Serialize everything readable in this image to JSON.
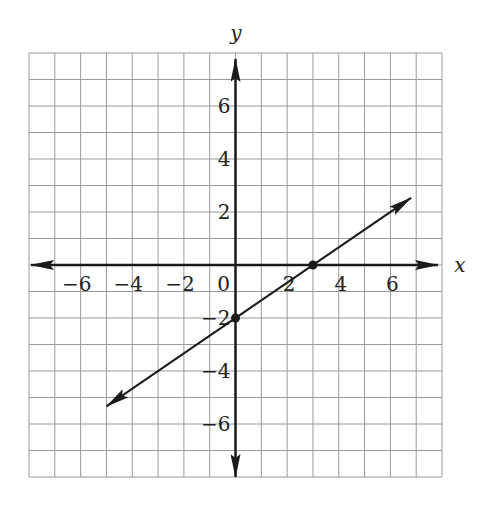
{
  "chart_data": {
    "type": "line",
    "title": "",
    "xlabel": "x",
    "ylabel": "y",
    "xlim": [
      -8,
      8
    ],
    "ylim": [
      -8,
      8
    ],
    "grid": true,
    "grid_step": 1,
    "x_ticks": [
      -6,
      -4,
      -2,
      0,
      2,
      4,
      6
    ],
    "y_ticks": [
      -6,
      -4,
      -2,
      2,
      4,
      6
    ],
    "x_tick_labels": [
      "−6",
      "−4",
      "−2",
      "0",
      "2",
      "4",
      "6"
    ],
    "y_tick_labels": [
      "−6",
      "−4",
      "−2",
      "2",
      "4",
      "6"
    ],
    "series": [
      {
        "name": "line",
        "equation": "y = (2/3)x - 2",
        "slope": 0.6667,
        "intercept": -2,
        "x_start": -5,
        "x_end": 6.8,
        "arrows": "both",
        "marked_points": [
          [
            0,
            -2
          ],
          [
            3,
            0
          ]
        ]
      }
    ],
    "colors": {
      "grid": "#9a9a9a",
      "axes": "#1a1a1a",
      "line": "#1a1a1a"
    }
  }
}
